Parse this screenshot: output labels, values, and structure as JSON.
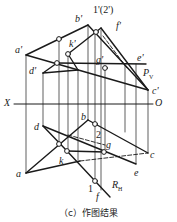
{
  "caption": "（c）作图结果",
  "labels": {
    "b_prime": "b'",
    "one_two_prime": "1'(2')",
    "f_prime": "f'",
    "a_prime": "a'",
    "k_prime": "k'",
    "g_prime": "g'",
    "e_prime": "e'",
    "d_prime": "d'",
    "pv": "P",
    "pv_sub": "V",
    "c_prime": "c'",
    "x_axis": "X",
    "o_axis": "O",
    "b": "b",
    "d": "d",
    "two": "2",
    "g": "g",
    "k": "k",
    "c": "c",
    "a": "a",
    "e": "e",
    "one": "1",
    "f": "f",
    "rh": "R",
    "rh_sub": "H"
  },
  "colors": {
    "line": "#1a1a1a",
    "background": "#ffffff"
  }
}
